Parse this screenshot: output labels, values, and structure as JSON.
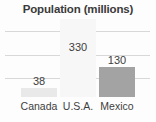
{
  "chart_data": {
    "type": "bar",
    "title": "Population (millions)",
    "xlabel": "",
    "ylabel": "",
    "categories": [
      "Canada",
      "U.S.A.",
      "Mexico"
    ],
    "values": [
      38,
      130,
      330
    ],
    "value_labels": [
      "38",
      "330",
      "130"
    ],
    "series": [
      {
        "name": "Population (millions)",
        "points": [
          {
            "category": "Canada",
            "value": 38,
            "label": "38",
            "color": "#e9e9e9"
          },
          {
            "category": "U.S.A.",
            "value": 330,
            "label": "330",
            "color": "#f7f7f7"
          },
          {
            "category": "Mexico",
            "value": 130,
            "label": "130",
            "color": "#a3a3a3"
          }
        ]
      }
    ],
    "ylim": [
      0,
      340
    ],
    "grid": true,
    "gridline_count": 3,
    "legend": "none",
    "bar_colors": {
      "canada": "#e9e9e9",
      "usa": "#f7f7f7",
      "mexico": "#a3a3a3"
    },
    "text_color": "#3d3d3d",
    "title_color": "#3a3a3a",
    "gridline_color": "#d8d8d8",
    "background": "#fdfdfd"
  }
}
